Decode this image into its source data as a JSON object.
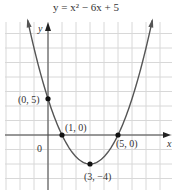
{
  "chart_data": {
    "type": "line",
    "title": "y = x² − 6x + 5",
    "xlabel": "x",
    "ylabel": "y",
    "origin_label": "0",
    "xlim": [
      -3,
      9
    ],
    "ylim": [
      -7,
      16
    ],
    "grid": true,
    "x_unit_per_square": 1,
    "y_unit_per_square": 2,
    "function": "x^2 - 6x + 5",
    "points": [
      {
        "x": 0,
        "y": 5,
        "label": "(0, 5)"
      },
      {
        "x": 1,
        "y": 0,
        "label": "(1, 0)"
      },
      {
        "x": 5,
        "y": 0,
        "label": "(5, 0)"
      },
      {
        "x": 3,
        "y": -4,
        "label": "(3, −4)"
      }
    ],
    "colors": {
      "curve": "#555555",
      "grid": "#d8d8d8",
      "axis": "#444444",
      "point": "#111111"
    }
  }
}
